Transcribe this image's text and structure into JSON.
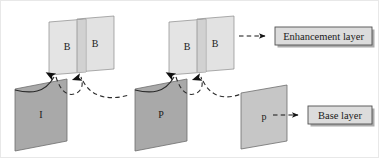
{
  "diagram": {
    "type": "layer-structure",
    "colors": {
      "enhancement_plane_fill": "#e2e2e2",
      "enhancement_overlap_fill": "#cfcfcf",
      "base_plane_fill_dark": "#a8a8a8",
      "base_plane_fill_light": "#c8c8c8",
      "stroke": "#6f6f6f",
      "arrow": "#1a1a1a",
      "legend_box_fill": "#dcdcdc",
      "legend_box_border": "#5a5a5a",
      "legend_shadow": "#9a9a9a",
      "background": "#ffffff"
    },
    "enhancement_groups": [
      {
        "group": 1,
        "front_label": "B",
        "back_label": "B"
      },
      {
        "group": 2,
        "front_label": "B",
        "back_label": "B"
      }
    ],
    "base_frames": [
      {
        "label": "I",
        "shade": "dark"
      },
      {
        "label": "P",
        "shade": "dark"
      },
      {
        "label": "p",
        "shade": "light"
      }
    ],
    "legend": [
      {
        "key": "enhancement",
        "label": "Enhancement layer",
        "arrow_style": "dashed"
      },
      {
        "key": "base",
        "label": "Base layer",
        "arrow_style": "dashed"
      }
    ],
    "prediction_arrows": {
      "solid_count": 2,
      "dashed_count": 4,
      "arrowhead_count": 4,
      "direction": "base-to-enhancement"
    }
  }
}
